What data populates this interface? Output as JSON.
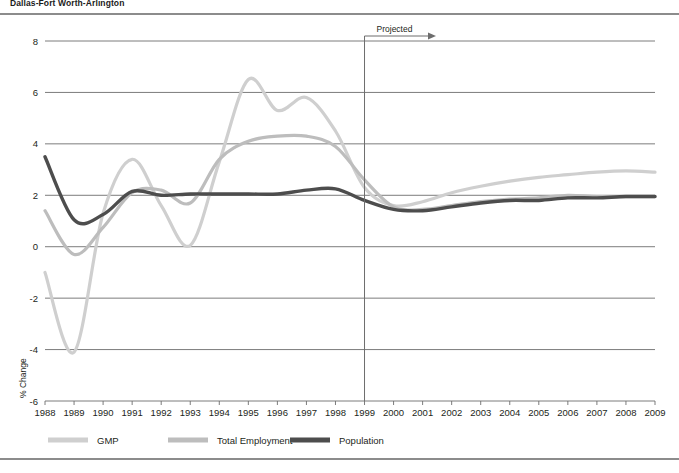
{
  "chart_title": "Dallas-Fort Worth-Arlington",
  "annotation": {
    "projected_label": "Projected",
    "projected_start_year": 1999
  },
  "chart_data": {
    "type": "line",
    "title": "Dallas-Fort Worth-Arlington",
    "xlabel": "",
    "ylabel": "% Change",
    "ylim": [
      -6,
      8
    ],
    "xlim": [
      1988,
      2009
    ],
    "ytick_labels": [
      "8",
      "6",
      "4",
      "2",
      "0",
      "-2",
      "-4",
      "-6"
    ],
    "yticks": [
      8,
      6,
      4,
      2,
      0,
      -2,
      -4,
      -6
    ],
    "grid": true,
    "legend_position": "bottom",
    "x": [
      1988,
      1989,
      1990,
      1991,
      1992,
      1993,
      1994,
      1995,
      1996,
      1997,
      1998,
      1999,
      2000,
      2001,
      2002,
      2003,
      2004,
      2005,
      2006,
      2007,
      2008,
      2009
    ],
    "categories": [
      "1988",
      "1989",
      "1990",
      "1991",
      "1992",
      "1993",
      "1994",
      "1995",
      "1996",
      "1997",
      "1998",
      "1999",
      "2000",
      "2001",
      "2002",
      "2003",
      "2004",
      "2005",
      "2006",
      "2007",
      "2008",
      "2009"
    ],
    "series": [
      {
        "name": "GMP",
        "color": "#cfcfcf",
        "values": [
          -1.0,
          -4.1,
          1.3,
          3.4,
          1.6,
          0.05,
          3.3,
          6.5,
          5.3,
          5.8,
          4.5,
          2.3,
          1.6,
          1.75,
          2.1,
          2.35,
          2.55,
          2.7,
          2.8,
          2.9,
          2.95,
          2.9
        ]
      },
      {
        "name": "Total Employment",
        "color": "#bdbdbd",
        "values": [
          1.4,
          -0.3,
          0.75,
          2.1,
          2.2,
          1.7,
          3.4,
          4.1,
          4.3,
          4.3,
          3.9,
          2.6,
          1.55,
          1.45,
          1.6,
          1.75,
          1.85,
          1.9,
          2.0,
          1.95,
          1.95,
          1.95
        ]
      },
      {
        "name": "Population",
        "color": "#4d4d4d",
        "values": [
          3.5,
          1.05,
          1.25,
          2.15,
          2.0,
          2.05,
          2.05,
          2.05,
          2.05,
          2.2,
          2.25,
          1.8,
          1.45,
          1.4,
          1.55,
          1.7,
          1.8,
          1.8,
          1.9,
          1.9,
          1.95,
          1.95
        ]
      }
    ]
  },
  "legend": {
    "items": [
      {
        "label": "GMP",
        "color": "#cfcfcf"
      },
      {
        "label": "Total Employment",
        "color": "#bdbdbd"
      },
      {
        "label": "Population",
        "color": "#4d4d4d"
      }
    ]
  }
}
